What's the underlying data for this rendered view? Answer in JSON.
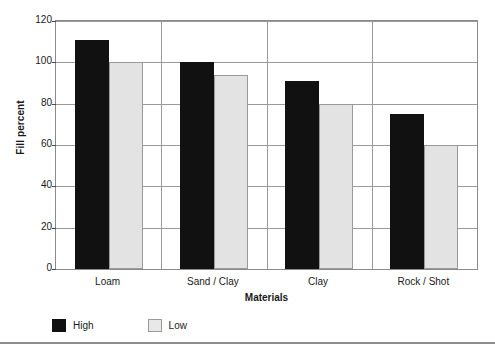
{
  "chart_data": {
    "type": "bar",
    "title": "",
    "xlabel": "Materials",
    "ylabel": "Fill percent",
    "categories": [
      "Loam",
      "Sand / Clay",
      "Clay",
      "Rock / Shot"
    ],
    "series": [
      {
        "name": "High",
        "color": "#111111",
        "values": [
          111,
          100,
          91,
          75
        ]
      },
      {
        "name": "Low",
        "color": "#e3e3e3",
        "values": [
          100,
          94,
          80,
          60
        ]
      }
    ],
    "ylim": [
      0,
      120
    ],
    "yticks": [
      0,
      20,
      40,
      60,
      80,
      100,
      120
    ],
    "ytick_labels": [
      "0",
      "20",
      "40",
      "60",
      "80",
      "100",
      "120"
    ],
    "grid": "horizontal",
    "legend_position": "bottom-left",
    "legend_entries": [
      "High",
      "Low"
    ]
  }
}
